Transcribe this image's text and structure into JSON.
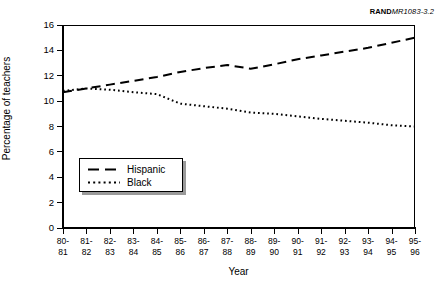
{
  "figure": {
    "rand_id_bold": "RAND",
    "rand_id_rest": "MR1083-3.2"
  },
  "chart_data": {
    "type": "line",
    "title": "",
    "xlabel": "Year",
    "ylabel": "Percentage of teachers",
    "categories": [
      "80-81",
      "81-82",
      "82-83",
      "83-84",
      "84-85",
      "85-86",
      "86-87",
      "87-88",
      "88-89",
      "89-90",
      "90-91",
      "91-92",
      "92-93",
      "93-94",
      "94-95",
      "95-96"
    ],
    "category_lines": [
      [
        "80-",
        "81"
      ],
      [
        "81-",
        "82"
      ],
      [
        "82-",
        "83"
      ],
      [
        "83-",
        "84"
      ],
      [
        "84-",
        "85"
      ],
      [
        "85-",
        "86"
      ],
      [
        "86-",
        "87"
      ],
      [
        "87-",
        "88"
      ],
      [
        "88-",
        "89"
      ],
      [
        "89-",
        "90"
      ],
      [
        "90-",
        "91"
      ],
      [
        "91-",
        "92"
      ],
      [
        "92-",
        "93"
      ],
      [
        "93-",
        "94"
      ],
      [
        "94-",
        "95"
      ],
      [
        "95-",
        "96"
      ]
    ],
    "series": [
      {
        "name": "Hispanic",
        "style": "dashed",
        "values": [
          10.7,
          11.0,
          11.3,
          11.6,
          11.9,
          12.3,
          12.6,
          12.85,
          12.55,
          12.9,
          13.3,
          13.6,
          13.9,
          14.2,
          14.6,
          15.0
        ]
      },
      {
        "name": "Black",
        "style": "dotted",
        "values": [
          10.8,
          11.0,
          10.9,
          10.7,
          10.55,
          9.8,
          9.6,
          9.4,
          9.1,
          9.0,
          8.8,
          8.6,
          8.45,
          8.3,
          8.1,
          8.0
        ]
      }
    ],
    "ylim": [
      0,
      16
    ],
    "yticks": [
      0,
      2,
      4,
      6,
      8,
      10,
      12,
      14,
      16
    ],
    "grid": false,
    "legend_position": "lower-left",
    "colors": {
      "line": "#000000",
      "axis": "#000000",
      "background": "#ffffff",
      "legend_shadow": "#9a9a9a"
    }
  }
}
